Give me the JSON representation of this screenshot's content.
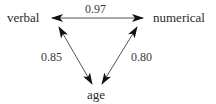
{
  "diagram": {
    "nodes": [
      {
        "id": "verbal",
        "label": "verbal"
      },
      {
        "id": "numerical",
        "label": "numerical"
      },
      {
        "id": "age",
        "label": "age"
      }
    ],
    "edges": [
      {
        "from": "verbal",
        "to": "numerical",
        "label": "0.97",
        "bidirectional": true
      },
      {
        "from": "verbal",
        "to": "age",
        "label": "0.85",
        "bidirectional": true
      },
      {
        "from": "numerical",
        "to": "age",
        "label": "0.80",
        "bidirectional": true
      }
    ],
    "colors": {
      "line": "#555555",
      "arrowhead": "#111111",
      "text": "#2a2a2a"
    }
  }
}
